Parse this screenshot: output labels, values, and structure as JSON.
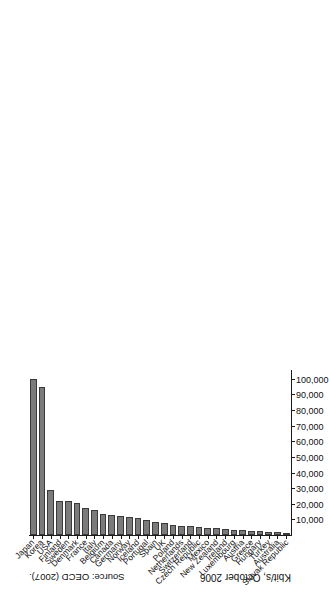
{
  "figure": {
    "axis_title": "Kbit/s, October 2006",
    "source_note": "Source: OECD (2007)."
  },
  "chart_data": {
    "type": "bar",
    "orientation": "horizontal",
    "title": "",
    "subtitle": "",
    "xlabel": "Kbit/s, October 2006",
    "ylabel": "",
    "xlim": [
      0,
      105000
    ],
    "grid": false,
    "legend": null,
    "tick_labels": [
      "10,000",
      "20,000",
      "30,000",
      "40,000",
      "50,000",
      "60,000",
      "70,000",
      "80,000",
      "90,000",
      "100,000"
    ],
    "tick_values": [
      10000,
      20000,
      30000,
      40000,
      50000,
      60000,
      70000,
      80000,
      90000,
      100000
    ],
    "categories": [
      "Japan",
      "Korea",
      "USA",
      "Finland",
      "Sweden",
      "Denmark",
      "France",
      "Italy",
      "Belgium",
      "Canada",
      "Germany",
      "Norway",
      "Iceland",
      "Portugal",
      "Spain",
      "UK",
      "Poland",
      "Netherlands",
      "Switzerland",
      "Czech Republic",
      "Mexico",
      "New Zealand",
      "Ireland",
      "Luxembourg",
      "Austria",
      "Greece",
      "Hungary",
      "Turkey",
      "Australia",
      "Slovak Republic"
    ],
    "values": [
      100000,
      95000,
      29000,
      22000,
      21500,
      20500,
      17000,
      16000,
      13500,
      12500,
      12000,
      11500,
      11000,
      9500,
      8500,
      8000,
      6500,
      6000,
      5500,
      5000,
      4500,
      4200,
      3800,
      3400,
      3000,
      2600,
      2300,
      2000,
      1800,
      1500
    ],
    "source": "Source: OECD (2007)."
  }
}
